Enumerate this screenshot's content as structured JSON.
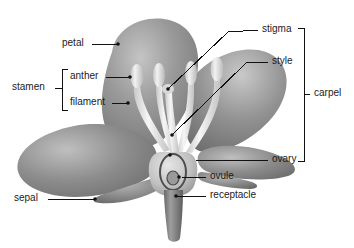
{
  "diagram": {
    "background_color": "#ffffff",
    "line_color": "#111111",
    "palette": {
      "petal_mid": "#8f8f8f",
      "petal_light": "#bdbdbd",
      "petal_dark": "#6e6e6e",
      "filament": "#efefef",
      "anther": "#e2e2e2",
      "stem": "#7b7b7b",
      "ovary_wall": "#cfcfcf",
      "ovule": "#9a9a9a"
    },
    "labels": [
      {
        "id": "petal",
        "text": "petal",
        "x": 62,
        "y": 38,
        "anchor": "right"
      },
      {
        "id": "stamen",
        "text": "stamen",
        "x": 12,
        "y": 82,
        "anchor": "right"
      },
      {
        "id": "anther",
        "text": "anther",
        "x": 66,
        "y": 68,
        "anchor": "right"
      },
      {
        "id": "filament",
        "text": "filament",
        "x": 66,
        "y": 94,
        "anchor": "right"
      },
      {
        "id": "sepal",
        "text": "sepal",
        "x": 18,
        "y": 193,
        "anchor": "right"
      },
      {
        "id": "stigma",
        "text": "stigma",
        "x": 262,
        "y": 24,
        "anchor": "left"
      },
      {
        "id": "style",
        "text": "style",
        "x": 272,
        "y": 56,
        "anchor": "left"
      },
      {
        "id": "carpel",
        "text": "carpel",
        "x": 312,
        "y": 88,
        "anchor": "left"
      },
      {
        "id": "ovary",
        "text": "ovary",
        "x": 272,
        "y": 154,
        "anchor": "left"
      },
      {
        "id": "ovule",
        "text": "ovule",
        "x": 210,
        "y": 171,
        "anchor": "left"
      },
      {
        "id": "receptacle",
        "text": "receptacle",
        "x": 210,
        "y": 190,
        "anchor": "left"
      }
    ],
    "brackets": [
      {
        "id": "stamen-bracket",
        "group": "stamen",
        "members": [
          "anther",
          "filament"
        ]
      },
      {
        "id": "carpel-bracket",
        "group": "carpel",
        "members": [
          "stigma",
          "style",
          "ovary"
        ]
      }
    ],
    "parts": [
      {
        "id": "petal",
        "name": "petal"
      },
      {
        "id": "sepal",
        "name": "sepal"
      },
      {
        "id": "anther",
        "name": "anther"
      },
      {
        "id": "filament",
        "name": "filament"
      },
      {
        "id": "stigma",
        "name": "stigma"
      },
      {
        "id": "style",
        "name": "style"
      },
      {
        "id": "ovary",
        "name": "ovary"
      },
      {
        "id": "ovule",
        "name": "ovule"
      },
      {
        "id": "receptacle",
        "name": "receptacle"
      }
    ]
  }
}
